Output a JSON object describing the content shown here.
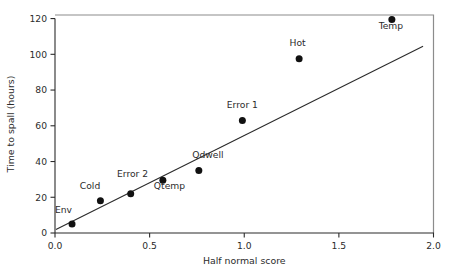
{
  "chart_data": {
    "type": "scatter",
    "title": "",
    "xlabel": "Half normal score",
    "ylabel": "Time to spall (hours)",
    "xlim": [
      0.0,
      2.0
    ],
    "ylim": [
      0,
      122
    ],
    "grid": false,
    "legend": null,
    "xticks": [
      "0.0",
      "0.5",
      "1.0",
      "1.5",
      "2.0"
    ],
    "xtick_values": [
      0.0,
      0.5,
      1.0,
      1.5,
      2.0
    ],
    "yticks": [
      "0",
      "20",
      "40",
      "60",
      "80",
      "100",
      "120"
    ],
    "ytick_values": [
      0,
      20,
      40,
      60,
      80,
      100,
      120
    ],
    "points": [
      {
        "label": "Env",
        "x": 0.09,
        "y": 5.0,
        "label_dx": -0.045,
        "label_dy": 11.5
      },
      {
        "label": "Cold",
        "x": 0.24,
        "y": 18.0,
        "label_dx": -0.055,
        "label_dy": 11.5
      },
      {
        "label": "Error 2",
        "x": 0.4,
        "y": 22.0,
        "label_dx": 0.01,
        "label_dy": 17.0
      },
      {
        "label": "Qtemp",
        "x": 0.57,
        "y": 29.5,
        "label_dx": 0.035,
        "label_dy": -9.0
      },
      {
        "label": "Qdwell",
        "x": 0.76,
        "y": 35.0,
        "label_dx": 0.048,
        "label_dy": 12.0
      },
      {
        "label": "Error 1",
        "x": 0.99,
        "y": 63.0,
        "label_dx": 0.0,
        "label_dy": 12.5
      },
      {
        "label": "Hot",
        "x": 1.29,
        "y": 97.5,
        "label_dx": -0.008,
        "label_dy": 13.0
      },
      {
        "label": "Temp",
        "x": 1.78,
        "y": 119.5,
        "label_dx": -0.005,
        "label_dy": -10.0
      }
    ],
    "fit_line": {
      "name": "reference line",
      "x_start": 0.005,
      "y_start": 2.0,
      "x_end": 1.945,
      "y_end": 104.5
    },
    "colors": {
      "point": "#111111",
      "line": "#2b2b2b",
      "frame": "#8c8c8c",
      "text": "#2b2b2b",
      "background": "#ffffff"
    }
  }
}
